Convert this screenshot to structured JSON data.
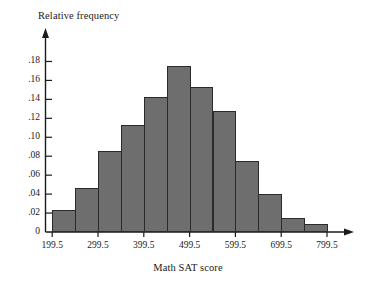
{
  "chart_data": {
    "type": "bar",
    "title": "",
    "xlabel": "Math SAT score",
    "ylabel": "Relative frequency",
    "categories": [
      "199.5-249.5",
      "249.5-299.5",
      "299.5-349.5",
      "349.5-399.5",
      "399.5-449.5",
      "449.5-499.5",
      "499.5-549.5",
      "549.5-599.5",
      "599.5-649.5",
      "649.5-699.5",
      "699.5-749.5",
      "749.5-799.5"
    ],
    "bin_edges": [
      199.5,
      249.5,
      299.5,
      349.5,
      399.5,
      449.5,
      499.5,
      549.5,
      599.5,
      649.5,
      699.5,
      749.5,
      799.5
    ],
    "values": [
      0.023,
      0.046,
      0.085,
      0.113,
      0.143,
      0.175,
      0.153,
      0.128,
      0.075,
      0.04,
      0.015,
      0.008
    ],
    "xlim": [
      199.5,
      799.5
    ],
    "ylim": [
      0,
      0.19
    ],
    "grid": false,
    "legend": null,
    "bar_color": "#6e6e6e",
    "bar_edge_color": "#2b2b2b",
    "x_tick_labels": [
      "199.5",
      "299.5",
      "399.5",
      "499.5",
      "599.5",
      "699.5",
      "799.5"
    ],
    "x_tick_values": [
      199.5,
      299.5,
      399.5,
      499.5,
      599.5,
      699.5,
      799.5
    ],
    "y_tick_labels": [
      "0",
      ".02",
      ".04",
      ".06",
      ".08",
      ".10",
      ".12",
      ".14",
      ".16",
      ".18"
    ],
    "y_tick_values": [
      0,
      0.02,
      0.04,
      0.06,
      0.08,
      0.1,
      0.12,
      0.14,
      0.16,
      0.18
    ]
  }
}
